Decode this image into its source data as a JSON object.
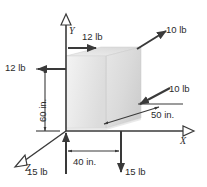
{
  "figure": {
    "type": "engineering-free-body-diagram",
    "background_color": "#ffffff",
    "ink_color": "#2b2b2b",
    "block_fill_light": "#f0f0f0",
    "block_fill_mid": "#e2e2e2",
    "block_fill_dark": "#d2d2d2"
  },
  "axes": [
    {
      "name": "y-axis",
      "label": "Y",
      "direction": "up",
      "arrow": "open-triangle"
    },
    {
      "name": "x-axis",
      "label": "X",
      "direction": "right",
      "arrow": "open-triangle"
    },
    {
      "name": "z-axis",
      "label": "Z",
      "direction": "down-left",
      "arrow": "open-triangle"
    }
  ],
  "forces": [
    {
      "name": "force-top-left-12lb",
      "label": "12 lb",
      "magnitude": 12,
      "unit": "lb",
      "direction": "right"
    },
    {
      "name": "force-left-12lb",
      "label": "12 lb",
      "magnitude": 12,
      "unit": "lb",
      "direction": "left"
    },
    {
      "name": "force-upper-right-10lb",
      "label": "10 lb",
      "magnitude": 10,
      "unit": "lb",
      "direction": "up-right"
    },
    {
      "name": "force-lower-right-10lb",
      "label": "10 lb",
      "magnitude": 10,
      "unit": "lb",
      "direction": "down-left"
    },
    {
      "name": "force-bottom-left-15lb",
      "label": "15 lb",
      "magnitude": 15,
      "unit": "lb",
      "direction": "up"
    },
    {
      "name": "force-bottom-right-15lb",
      "label": "15 lb",
      "magnitude": 15,
      "unit": "lb",
      "direction": "down"
    }
  ],
  "dimensions": [
    {
      "name": "dimension-height-60in",
      "label": "60 in.",
      "value": 60,
      "unit": "in.",
      "orientation": "vertical"
    },
    {
      "name": "dimension-width-40in",
      "label": "40 in.",
      "value": 40,
      "unit": "in.",
      "orientation": "horizontal"
    },
    {
      "name": "dimension-depth-50in",
      "label": "50 in.",
      "value": 50,
      "unit": "in.",
      "orientation": "oblique"
    }
  ],
  "labels": {
    "force_12lb_top": "12 lb",
    "force_12lb_left": "12 lb",
    "force_10lb_upper": "10 lb",
    "force_10lb_lower": "10 lb",
    "force_15lb_left": "15 lb",
    "force_15lb_right": "15 lb",
    "dim_60in": "60 in.",
    "dim_40in": "40 in.",
    "dim_50in": "50 in.",
    "axis_y": "Y",
    "axis_x": "X",
    "axis_z": "Z"
  }
}
